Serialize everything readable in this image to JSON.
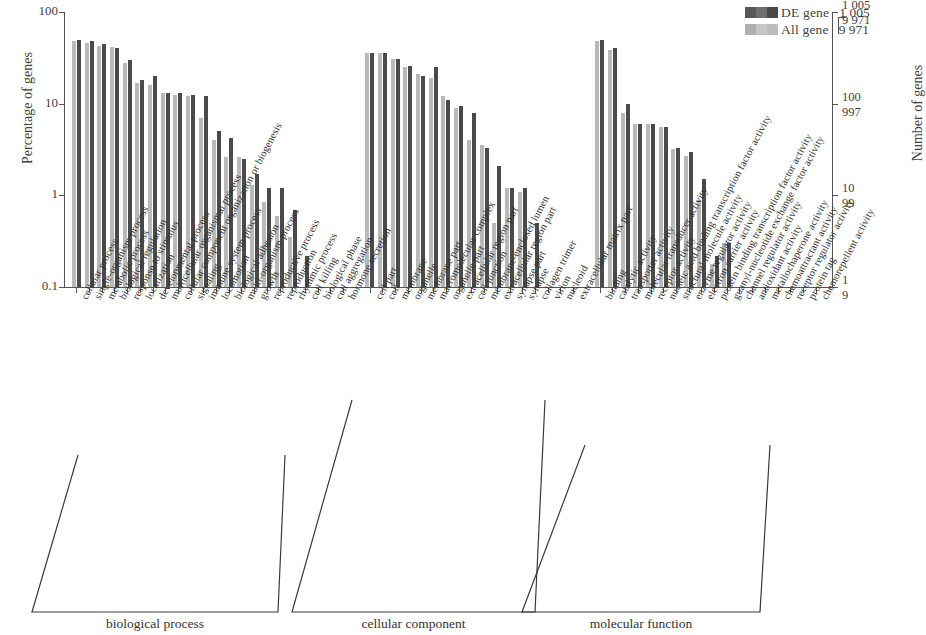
{
  "legend": {
    "series": [
      {
        "key": "de",
        "label": "DE gene",
        "count": "1 005",
        "color": "#4a4a4a"
      },
      {
        "key": "all",
        "label": "All gene",
        "count": "9 971",
        "color": "#b9b9b9"
      }
    ]
  },
  "axes": {
    "left_title": "Percentage of genes",
    "right_title": "Number of genes",
    "left_ticks": [
      "100",
      "10",
      "1",
      "0.1"
    ],
    "right_ticks": [
      {
        "top": "1 005",
        "bottom": "9 971"
      },
      {
        "top": "100",
        "bottom": "997"
      },
      {
        "top": "10",
        "bottom": "99"
      },
      {
        "top": "1",
        "bottom": "9"
      }
    ]
  },
  "groups": [
    {
      "name": "biological process"
    },
    {
      "name": "cellular component"
    },
    {
      "name": "molecular function"
    }
  ],
  "chart_data": {
    "type": "bar",
    "title": "",
    "xlabel": "",
    "ylabel": "Percentage of genes",
    "ylabel_right": "Number of genes",
    "yscale": "log",
    "ylim": [
      0.1,
      100
    ],
    "ytick_values": [
      100,
      10,
      1,
      0.1
    ],
    "grid": false,
    "legend_position": "top-right",
    "series": [
      {
        "name": "DE gene",
        "total": 1005,
        "color": "#4a4a4a"
      },
      {
        "name": "All gene",
        "total": 9971,
        "color": "#b9b9b9"
      }
    ],
    "groups": [
      "biological process",
      "cellular component",
      "molecular function"
    ],
    "categories": [
      {
        "label": "cellular process",
        "group": "biological process",
        "de": 50.0,
        "all": 48.0
      },
      {
        "label": "single-organism process",
        "group": "biological process",
        "de": 48.0,
        "all": 46.0
      },
      {
        "label": "metabolic process",
        "group": "biological process",
        "de": 45.0,
        "all": 43.0
      },
      {
        "label": "biological regulation",
        "group": "biological process",
        "de": 40.0,
        "all": 42.0
      },
      {
        "label": "response to stimulus",
        "group": "biological process",
        "de": 30.0,
        "all": 28.0
      },
      {
        "label": "localization",
        "group": "biological process",
        "de": 18.0,
        "all": 17.0
      },
      {
        "label": "developmental process",
        "group": "biological process",
        "de": 20.0,
        "all": 16.0
      },
      {
        "label": "multicellular organismal process",
        "group": "biological process",
        "de": 13.0,
        "all": 13.0
      },
      {
        "label": "cellular component organization or biogenesis",
        "group": "biological process",
        "de": 13.0,
        "all": 12.5
      },
      {
        "label": "signaling",
        "group": "biological process",
        "de": 12.5,
        "all": 12.0
      },
      {
        "label": "immune system process",
        "group": "biological process",
        "de": 12.0,
        "all": 7.0
      },
      {
        "label": "locomotion",
        "group": "biological process",
        "de": 5.0,
        "all": 4.0
      },
      {
        "label": "biological adhesion",
        "group": "biological process",
        "de": 4.2,
        "all": 2.6
      },
      {
        "label": "multi-organism process",
        "group": "biological process",
        "de": 2.5,
        "all": 2.6
      },
      {
        "label": "growth",
        "group": "biological process",
        "de": 1.7,
        "all": 1.3
      },
      {
        "label": "reproductive process",
        "group": "biological process",
        "de": 1.2,
        "all": 0.85
      },
      {
        "label": "reproduction",
        "group": "biological process",
        "de": 1.2,
        "all": 0.6
      },
      {
        "label": "rhythmic process",
        "group": "biological process",
        "de": 0.7,
        "all": 0.35
      },
      {
        "label": "cell killing",
        "group": "biological process",
        "de": 0.22,
        "all": 0.0
      },
      {
        "label": "biological phase",
        "group": "biological process",
        "de": 0.0,
        "all": 0.0
      },
      {
        "label": "cell aggregation",
        "group": "biological process",
        "de": 0.0,
        "all": 0.0
      },
      {
        "label": "hormone secretion",
        "group": "biological process",
        "de": 0.0,
        "all": 0.0
      },
      {
        "label": "cell part",
        "group": "cellular component",
        "de": 36.0,
        "all": 36.0
      },
      {
        "label": "cell",
        "group": "cellular component",
        "de": 36.0,
        "all": 36.0
      },
      {
        "label": "membrane",
        "group": "cellular component",
        "de": 31.0,
        "all": 31.0
      },
      {
        "label": "organelle",
        "group": "cellular component",
        "de": 26.0,
        "all": 25.0
      },
      {
        "label": "membrane part",
        "group": "cellular component",
        "de": 20.0,
        "all": 21.0
      },
      {
        "label": "macromolecular complex",
        "group": "cellular component",
        "de": 25.0,
        "all": 19.0
      },
      {
        "label": "organelle part",
        "group": "cellular component",
        "de": 11.0,
        "all": 12.0
      },
      {
        "label": "extracellular region part",
        "group": "cellular component",
        "de": 9.5,
        "all": 9.0
      },
      {
        "label": "cell junction",
        "group": "cellular component",
        "de": 8.0,
        "all": 4.0
      },
      {
        "label": "membrane-enclosed lumen",
        "group": "cellular component",
        "de": 3.3,
        "all": 3.5
      },
      {
        "label": "extracellular region part",
        "group": "cellular component",
        "de": 2.1,
        "all": 0.5
      },
      {
        "label": "synapse part",
        "group": "cellular component",
        "de": 1.2,
        "all": 1.2
      },
      {
        "label": "synapse",
        "group": "cellular component",
        "de": 1.2,
        "all": 1.1
      },
      {
        "label": "collagen trimer",
        "group": "cellular component",
        "de": 0.5,
        "all": 0.0
      },
      {
        "label": "virion",
        "group": "cellular component",
        "de": 0.0,
        "all": 0.0
      },
      {
        "label": "nucleoid",
        "group": "cellular component",
        "de": 0.0,
        "all": 0.0
      },
      {
        "label": "extracellular matrix part",
        "group": "cellular component",
        "de": 0.0,
        "all": 0.0
      },
      {
        "label": "binding",
        "group": "molecular function",
        "de": 50.0,
        "all": 48.0
      },
      {
        "label": "catalytic activity",
        "group": "molecular function",
        "de": 40.0,
        "all": 39.0
      },
      {
        "label": "transporter activity",
        "group": "molecular function",
        "de": 10.0,
        "all": 8.0
      },
      {
        "label": "molecular transducer activity",
        "group": "molecular function",
        "de": 6.0,
        "all": 6.0
      },
      {
        "label": "receptor activity",
        "group": "molecular function",
        "de": 6.0,
        "all": 6.0
      },
      {
        "label": "nucleic acid binding transcription factor activity",
        "group": "molecular function",
        "de": 5.5,
        "all": 5.5
      },
      {
        "label": "structural molecule activity",
        "group": "molecular function",
        "de": 3.3,
        "all": 3.2
      },
      {
        "label": "enzyme regulator activity",
        "group": "molecular function",
        "de": 3.0,
        "all": 2.7
      },
      {
        "label": "electron carrier activity",
        "group": "molecular function",
        "de": 1.5,
        "all": 0.9
      },
      {
        "label": "protein binding transcription factor activity",
        "group": "molecular function",
        "de": 0.22,
        "all": 0.18
      },
      {
        "label": "guanyl-nucleotide exchange factor activity",
        "group": "molecular function",
        "de": 0.3,
        "all": 0.3
      },
      {
        "label": "channel regulator activity",
        "group": "molecular function",
        "de": 0.0,
        "all": 0.0
      },
      {
        "label": "antioxidant activity",
        "group": "molecular function",
        "de": 0.0,
        "all": 0.0
      },
      {
        "label": "metallochaperone activity",
        "group": "molecular function",
        "de": 0.0,
        "all": 0.0
      },
      {
        "label": "chemoattractant activity",
        "group": "molecular function",
        "de": 0.0,
        "all": 0.0
      },
      {
        "label": "receptor regulator activity",
        "group": "molecular function",
        "de": 0.0,
        "all": 0.0
      },
      {
        "label": "protein tag",
        "group": "molecular function",
        "de": 0.0,
        "all": 0.0
      },
      {
        "label": "chemorepellent activity",
        "group": "molecular function",
        "de": 0.0,
        "all": 0.0
      }
    ]
  }
}
